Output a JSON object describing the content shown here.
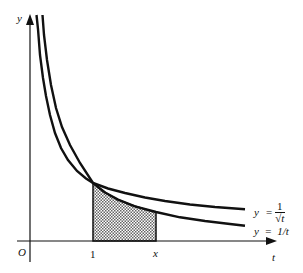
{
  "diagram": {
    "axes": {
      "y_label": "y",
      "x_label": "t",
      "origin_label": "O",
      "tick_1": "1",
      "tick_x": "x"
    },
    "curves": [
      {
        "name": "y = 1/sqrt(t)",
        "label_lhs": "y",
        "label_eq": "=",
        "label_num": "1",
        "label_den": "√t"
      },
      {
        "name": "y = 1/t",
        "label_text": "y  =  1/t"
      }
    ],
    "shaded_region": {
      "from": "1",
      "to": "x",
      "under": "y = 1/t",
      "pattern": "dotted"
    },
    "colors": {
      "stroke": "#111111",
      "shade": "#9a9a9a",
      "background": "#ffffff"
    }
  }
}
